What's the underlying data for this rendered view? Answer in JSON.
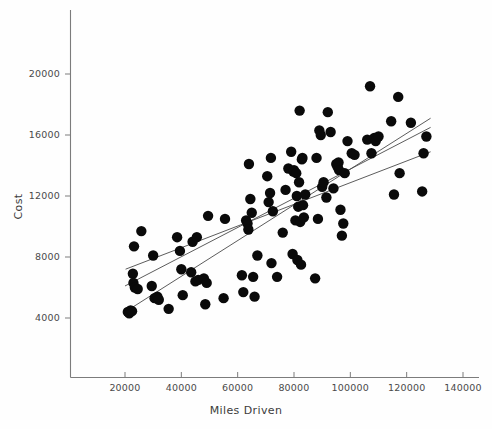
{
  "chart_data": {
    "type": "scatter",
    "title": "",
    "xlabel": "Miles Driven",
    "ylabel": "Cost",
    "xlim": [
      8000,
      148000
    ],
    "ylim": [
      1200,
      22600
    ],
    "grid": false,
    "legend": null,
    "xticks": [
      20000,
      40000,
      60000,
      80000,
      100000,
      120000,
      140000
    ],
    "xticklabels": [
      "20000",
      "40000",
      "60000",
      "80000",
      "100000",
      "120000",
      "140000"
    ],
    "yticks": [
      4000,
      8000,
      12000,
      16000,
      20000
    ],
    "yticklabels": [
      "4000",
      "8000",
      "12000",
      "16000",
      "20000"
    ],
    "marker": {
      "shape": "circle",
      "color": "#0a0a0a",
      "size": 5.2
    },
    "points": [
      [
        21000,
        4400
      ],
      [
        21500,
        4300
      ],
      [
        22000,
        4500
      ],
      [
        22500,
        4450
      ],
      [
        22800,
        6900
      ],
      [
        23000,
        6300
      ],
      [
        23200,
        8700
      ],
      [
        23500,
        6000
      ],
      [
        24500,
        5900
      ],
      [
        25800,
        9700
      ],
      [
        29500,
        6100
      ],
      [
        30000,
        8100
      ],
      [
        30500,
        5300
      ],
      [
        31500,
        5400
      ],
      [
        32000,
        5200
      ],
      [
        35500,
        4600
      ],
      [
        38500,
        9300
      ],
      [
        39500,
        8400
      ],
      [
        40000,
        7200
      ],
      [
        40500,
        5500
      ],
      [
        43500,
        7000
      ],
      [
        44000,
        9000
      ],
      [
        45000,
        6400
      ],
      [
        45500,
        9300
      ],
      [
        46000,
        6500
      ],
      [
        48000,
        6600
      ],
      [
        48500,
        4900
      ],
      [
        49000,
        6300
      ],
      [
        49500,
        10700
      ],
      [
        55000,
        5300
      ],
      [
        55500,
        10500
      ],
      [
        61500,
        6800
      ],
      [
        62000,
        5700
      ],
      [
        63000,
        10400
      ],
      [
        63500,
        10200
      ],
      [
        63800,
        9800
      ],
      [
        64000,
        14100
      ],
      [
        64500,
        11800
      ],
      [
        65000,
        10900
      ],
      [
        65500,
        6700
      ],
      [
        66000,
        5400
      ],
      [
        67000,
        8100
      ],
      [
        70500,
        13300
      ],
      [
        71000,
        11600
      ],
      [
        71500,
        12200
      ],
      [
        71800,
        14500
      ],
      [
        72000,
        7600
      ],
      [
        72500,
        11000
      ],
      [
        74000,
        6700
      ],
      [
        76000,
        9600
      ],
      [
        77000,
        12400
      ],
      [
        78000,
        13800
      ],
      [
        79000,
        14900
      ],
      [
        79500,
        8200
      ],
      [
        79800,
        13600
      ],
      [
        80000,
        13700
      ],
      [
        80500,
        10400
      ],
      [
        80800,
        13500
      ],
      [
        81000,
        12000
      ],
      [
        81200,
        7800
      ],
      [
        81500,
        11300
      ],
      [
        81800,
        12900
      ],
      [
        82000,
        17600
      ],
      [
        82200,
        10300
      ],
      [
        82500,
        7500
      ],
      [
        82800,
        14400
      ],
      [
        83000,
        14500
      ],
      [
        83200,
        11400
      ],
      [
        83500,
        10600
      ],
      [
        84000,
        12100
      ],
      [
        87500,
        6600
      ],
      [
        88000,
        14500
      ],
      [
        88500,
        10500
      ],
      [
        89000,
        16300
      ],
      [
        89500,
        16000
      ],
      [
        90000,
        12600
      ],
      [
        90500,
        12900
      ],
      [
        91500,
        11900
      ],
      [
        92000,
        17500
      ],
      [
        93000,
        16200
      ],
      [
        94000,
        12500
      ],
      [
        95000,
        14100
      ],
      [
        95500,
        13900
      ],
      [
        95800,
        14200
      ],
      [
        96000,
        13700
      ],
      [
        96500,
        11100
      ],
      [
        97000,
        9400
      ],
      [
        97500,
        10200
      ],
      [
        98000,
        13500
      ],
      [
        99000,
        15600
      ],
      [
        100500,
        14800
      ],
      [
        101500,
        14700
      ],
      [
        106000,
        15700
      ],
      [
        107000,
        19200
      ],
      [
        107500,
        14800
      ],
      [
        108500,
        15800
      ],
      [
        109000,
        15600
      ],
      [
        110000,
        15900
      ],
      [
        114500,
        16900
      ],
      [
        115500,
        12100
      ],
      [
        117000,
        18500
      ],
      [
        117500,
        13500
      ],
      [
        121500,
        16800
      ],
      [
        125500,
        12300
      ],
      [
        126000,
        14800
      ],
      [
        127000,
        15900
      ]
    ],
    "fit_lines": [
      {
        "name": "line-1",
        "x0": 20500,
        "y0": 4450,
        "x1": 128500,
        "y1": 17100
      },
      {
        "name": "line-2",
        "x0": 20000,
        "y0": 6100,
        "x1": 128500,
        "y1": 16500
      },
      {
        "name": "line-3",
        "x0": 20200,
        "y0": 7200,
        "x1": 128500,
        "y1": 14900
      }
    ]
  }
}
